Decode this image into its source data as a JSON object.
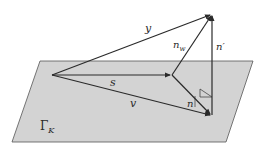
{
  "diagram": {
    "plane_label": "Γ",
    "plane_label_sub": "K",
    "vectors": [
      {
        "name": "y",
        "label": "y"
      },
      {
        "name": "s",
        "label": "s"
      },
      {
        "name": "v",
        "label": "v"
      },
      {
        "name": "n",
        "label": "n"
      },
      {
        "name": "n_w",
        "label": "n",
        "sub": "w"
      },
      {
        "name": "n_prime",
        "label": "n′"
      }
    ],
    "colors": {
      "plane_fill": "#d3d3d3",
      "plane_stroke": "#555555",
      "line": "#2a2a2a"
    }
  }
}
